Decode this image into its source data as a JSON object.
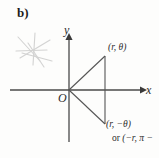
{
  "figure": {
    "part_label": "b)",
    "axes": {
      "x_label": "x",
      "y_label": "y",
      "origin_label": "O"
    },
    "annotations": {
      "point_upper": "(r, θ)",
      "point_lower": "(r, −θ)",
      "point_alt_prefix": "or ",
      "point_alt_value": "(−r, π −"
    },
    "marks": {
      "pencil_star": "star-scribble"
    },
    "colors": {
      "background": "#fdfdfc",
      "ink": "#2c2c2c",
      "line": "#4a4a4a",
      "scribble": "#9a9a9a"
    }
  }
}
